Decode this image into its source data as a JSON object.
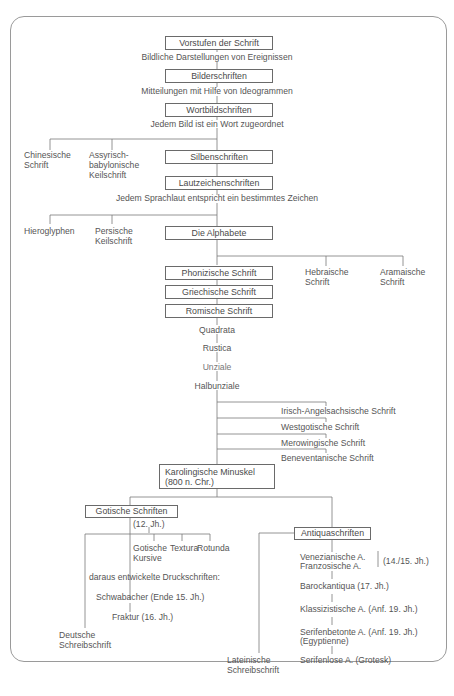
{
  "diagram": {
    "title_box": "Vorstufen der Schrift",
    "level1_note": "Bildliche Darstellungen von Ereignissen",
    "box_bilderschriften": "Bilderschriften",
    "level2_note": "Mitteilungen mit Hilfe von Ideogrammen",
    "box_wortbild": "Wortbildschriften",
    "level3_note": "Jedem Bild ist ein Wort zugeordnet",
    "chinesisch": [
      "Chinesische",
      "Schrift"
    ],
    "assyrisch": [
      "Assyrisch-",
      "babylonische",
      "Keilschrift"
    ],
    "box_silben": "Silbenschriften",
    "box_lautzeichen": "Lautzeichenschriften",
    "level4_note": "Jedem Sprachlaut entspricht ein bestimmtes Zeichen",
    "hieroglyphen": "Hieroglyphen",
    "persisch": [
      "Persische",
      "Keilschrift"
    ],
    "box_alphabete": "Die Alphabete",
    "box_phoenizisch": "Phonizische Schrift",
    "hebraeisch": [
      "Hebraische",
      "Schrift"
    ],
    "aramaeisch": [
      "Aramaische",
      "Schrift"
    ],
    "box_griechisch": "Griechische Schrift",
    "box_roemisch": "Romische Schrift",
    "roman_chain": [
      "Quadrata",
      "Rustica",
      "Unziale",
      "Halbunziale"
    ],
    "branches": [
      "Irisch-Angelsachsische Schrift",
      "Westgotische Schrift",
      "Merowingische Schrift",
      "Beneventanische Schrift"
    ],
    "box_karolingisch": [
      "Karolingische Minuskel",
      "(800 n. Chr.)"
    ],
    "box_gotisch": "Gotische Schriften",
    "gotisch_date": "(12. Jh.)",
    "gotisch_children": {
      "kursive": [
        "Gotische",
        "Kursive"
      ],
      "textura": "Textura",
      "rotunda": "Rotunda"
    },
    "druck_note": "daraus entwickelte Druckschriften:",
    "schwabacher": "Schwabacher (Ende 15. Jh.)",
    "fraktur": "Fraktur (16. Jh.)",
    "deutsche": [
      "Deutsche",
      "Schreibschrift"
    ],
    "box_antiqua": "Antiquaschriften",
    "antiqua_chain": {
      "venezianisch": "Venezianische A.",
      "franzoesisch": "Franzosische A.",
      "ven_fr_date": "(14./15. Jh.)",
      "barock": "Barockantiqua (17. Jh.)",
      "klassizistisch": "Klassizistische A. (Anf. 19. Jh.)",
      "serifenbetont": "Serifenbetonte A. (Anf. 19. Jh.)",
      "egyptienne": "(Egyptienne)",
      "serifenlos": "Serifenlose A. (Grotesk)"
    },
    "lateinisch": [
      "Lateinische",
      "Schreibschrift"
    ]
  }
}
